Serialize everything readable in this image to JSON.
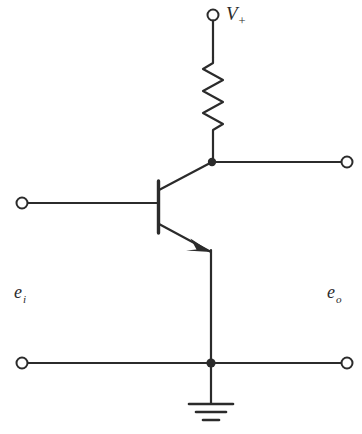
{
  "diagram": {
    "stroke_color": "#2b2b2b",
    "background_color": "#ffffff",
    "line_width": 2.2
  },
  "labels": {
    "supply": {
      "symbol": "V",
      "subscript": "+",
      "name": "positive supply voltage"
    },
    "input": {
      "symbol": "e",
      "subscript": "i",
      "name": "input voltage"
    },
    "output": {
      "symbol": "e",
      "subscript": "o",
      "name": "output voltage"
    }
  },
  "components": {
    "resistor": {
      "name": "collector resistor",
      "peaks": 6
    },
    "transistor": {
      "name": "npn-transistor",
      "type": "NPN",
      "terminals": [
        "base",
        "collector",
        "emitter"
      ]
    },
    "ground": {
      "name": "ground",
      "bars": 3
    }
  },
  "terminals": [
    {
      "name": "supply-terminal",
      "label": "V+"
    },
    {
      "name": "input-terminal",
      "label": "e_i"
    },
    {
      "name": "output-terminal-top",
      "label": "e_o"
    },
    {
      "name": "output-terminal-bottom",
      "label": "common"
    }
  ],
  "junctions": [
    {
      "name": "collector-output-junction"
    },
    {
      "name": "emitter-ground-junction"
    }
  ]
}
